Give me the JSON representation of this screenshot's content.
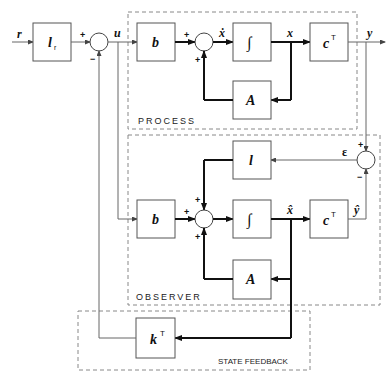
{
  "diagram": {
    "type": "block-diagram",
    "groups": {
      "process": "PROCESS",
      "observer": "OBSERVER",
      "state_feedback": "STATE FEEDBACK"
    },
    "blocks": {
      "prefilter": "l",
      "prefilter_sub": "r",
      "process_b": "b",
      "process_integrator": "∫",
      "process_c": "c",
      "process_c_sup": "T",
      "process_A": "A",
      "observer_l": "l",
      "observer_b": "b",
      "observer_integrator": "∫",
      "observer_c": "c",
      "observer_c_sup": "T",
      "observer_A": "A",
      "feedback_k": "k",
      "feedback_k_sup": "T"
    },
    "signals": {
      "reference": "r",
      "input": "u",
      "state_derivative": "ẋ",
      "state": "x",
      "output": "y",
      "estimated_state": "x̂",
      "estimated_output": "ŷ",
      "error": "ε"
    },
    "signs": {
      "plus": "+",
      "minus": "−"
    }
  }
}
